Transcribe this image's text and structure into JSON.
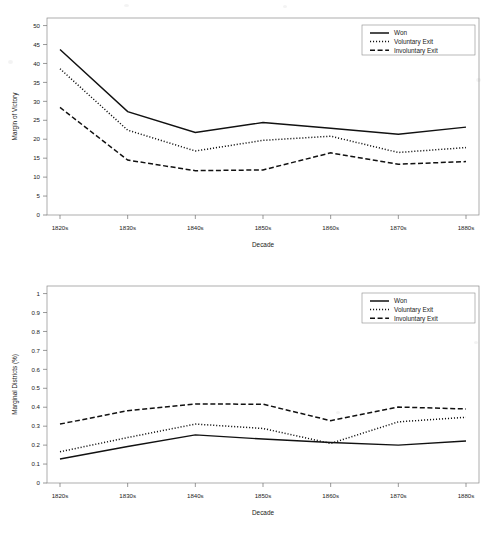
{
  "figure": {
    "background_color": "#ffffff",
    "line_color": "#111111",
    "axis_color": "#8a8a8a"
  },
  "legend": {
    "position": "top-right",
    "entries": [
      {
        "label": "Won",
        "style": "solid"
      },
      {
        "label": "Voluntary Exit",
        "style": "dotted"
      },
      {
        "label": "Involuntary Exit",
        "style": "dashed"
      }
    ]
  },
  "chart_data": [
    {
      "type": "line",
      "title": "",
      "xlabel": "Decade",
      "ylabel": "Margin of Victory",
      "categories": [
        "1820s",
        "1830s",
        "1840s",
        "1850s",
        "1860s",
        "1870s",
        "1880s"
      ],
      "xtick_labels": [
        "1820s",
        "1830s",
        "1840s",
        "1850s",
        "1860s",
        "1870s",
        "1880s"
      ],
      "ytick_labels": [
        "0",
        "5",
        "10",
        "15",
        "20",
        "25",
        "30",
        "35",
        "40",
        "45",
        "50"
      ],
      "ylim": [
        0,
        52
      ],
      "ytick_values": [
        0,
        5,
        10,
        15,
        20,
        25,
        30,
        35,
        40,
        45,
        50
      ],
      "grid": false,
      "legend_position": "top-right",
      "series": [
        {
          "name": "Won",
          "style": "solid",
          "values": [
            43.7,
            27.3,
            21.8,
            24.4,
            22.9,
            21.3,
            23.2
          ]
        },
        {
          "name": "Voluntary Exit",
          "style": "dotted",
          "values": [
            38.6,
            22.4,
            16.9,
            19.7,
            20.8,
            16.5,
            17.8
          ]
        },
        {
          "name": "Involuntary Exit",
          "style": "dashed",
          "values": [
            28.4,
            14.5,
            11.7,
            11.9,
            16.4,
            13.4,
            14.1
          ]
        }
      ]
    },
    {
      "type": "line",
      "title": "",
      "xlabel": "Decade",
      "ylabel": "Marginal Districts (%)",
      "categories": [
        "1820s",
        "1830s",
        "1840s",
        "1850s",
        "1860s",
        "1870s",
        "1880s"
      ],
      "xtick_labels": [
        "1820s",
        "1830s",
        "1840s",
        "1850s",
        "1860s",
        "1870s",
        "1880s"
      ],
      "ytick_labels": [
        "0",
        "0.1",
        "0.2",
        "0.3",
        "0.4",
        "0.5",
        "0.6",
        "0.7",
        "0.8",
        "0.9",
        "1"
      ],
      "ylim": [
        0,
        1.04
      ],
      "ytick_values": [
        0,
        0.1,
        0.2,
        0.3,
        0.4,
        0.5,
        0.6,
        0.7,
        0.8,
        0.9,
        1
      ],
      "grid": false,
      "legend_position": "top-right",
      "series": [
        {
          "name": "Won",
          "style": "solid",
          "values": [
            0.127,
            0.193,
            0.254,
            0.232,
            0.214,
            0.2,
            0.222
          ]
        },
        {
          "name": "Voluntary Exit",
          "style": "dotted",
          "values": [
            0.165,
            0.24,
            0.311,
            0.288,
            0.209,
            0.323,
            0.347
          ]
        },
        {
          "name": "Involuntary Exit",
          "style": "dashed",
          "values": [
            0.311,
            0.382,
            0.417,
            0.416,
            0.329,
            0.401,
            0.391
          ]
        }
      ]
    }
  ]
}
